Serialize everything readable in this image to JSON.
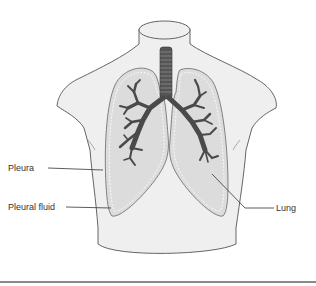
{
  "diagram": {
    "labels": {
      "pleura": "Pleura",
      "pleural_fluid": "Pleural fluid",
      "lung": "Lung"
    },
    "colors": {
      "background": "#ffffff",
      "torso_fill": "#efefef",
      "torso_outline": "#555555",
      "lung_fill": "#dcdcdc",
      "pleura_dash": "#ffffff",
      "bronchi": "#4a4a4a",
      "leader_line": "#333333",
      "bottom_rule": "#8a8a8a"
    }
  }
}
